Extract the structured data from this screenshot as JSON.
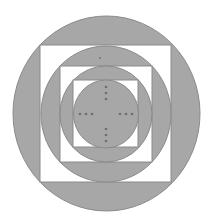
{
  "diagram": {
    "colors": {
      "background": "#ffffff",
      "fill": "#a7a7a7",
      "stroke": "#8a8a8a",
      "dot": "#6e6e6e"
    },
    "center": [
      106,
      114
    ],
    "shapes": [
      {
        "kind": "circle",
        "cx": 106.5,
        "cy": 113.5,
        "rx": 93.5,
        "ry": 97.5,
        "fill": "gray"
      },
      {
        "kind": "square",
        "x": 40,
        "y": 45,
        "w": 131,
        "h": 137,
        "fill": "white"
      },
      {
        "kind": "circle",
        "cx": 106,
        "cy": 114,
        "rx": 65,
        "ry": 68,
        "fill": "gray"
      },
      {
        "kind": "square",
        "x": 60,
        "y": 66,
        "w": 92,
        "h": 96,
        "fill": "white"
      },
      {
        "kind": "circle",
        "cx": 106,
        "cy": 114,
        "rx": 46,
        "ry": 48,
        "fill": "gray"
      },
      {
        "kind": "square",
        "x": 73,
        "y": 80,
        "w": 65,
        "h": 67,
        "fill": "white"
      },
      {
        "kind": "circle",
        "cx": 106,
        "cy": 114,
        "rx": 32.5,
        "ry": 34,
        "fill": "gray"
      }
    ],
    "dots": [
      [
        100,
        58
      ],
      [
        106,
        87
      ],
      [
        106,
        93
      ],
      [
        106,
        99
      ],
      [
        80,
        114
      ],
      [
        86,
        114
      ],
      [
        92,
        114
      ],
      [
        120,
        114
      ],
      [
        126,
        114
      ],
      [
        132,
        114
      ],
      [
        106,
        129
      ],
      [
        106,
        135
      ],
      [
        106,
        141
      ]
    ]
  }
}
